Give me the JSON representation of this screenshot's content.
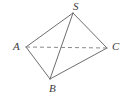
{
  "figure": {
    "type": "geometry-diagram",
    "shape_name": "tetrahedron",
    "width": 124,
    "height": 97,
    "background_color": "#ffffff",
    "line_color": "#6e6e6e",
    "label_color": "#3b3b3b",
    "vertices": [
      {
        "name": "S",
        "label": "S",
        "x": 73,
        "y": 13,
        "label_x": 73,
        "label_y": 1
      },
      {
        "name": "A",
        "label": "A",
        "x": 26,
        "y": 47,
        "label_x": 13,
        "label_y": 41
      },
      {
        "name": "C",
        "label": "C",
        "x": 107,
        "y": 48,
        "label_x": 112,
        "label_y": 41
      },
      {
        "name": "B",
        "label": "B",
        "x": 50,
        "y": 79,
        "label_x": 49,
        "label_y": 83
      }
    ],
    "edges": [
      {
        "name": "edge-S-A",
        "from": "S",
        "to": "A",
        "style": "solid",
        "x1": 73,
        "y1": 13,
        "x2": 26,
        "y2": 47
      },
      {
        "name": "edge-S-C",
        "from": "S",
        "to": "C",
        "style": "solid",
        "x1": 73,
        "y1": 13,
        "x2": 107,
        "y2": 48
      },
      {
        "name": "edge-S-B",
        "from": "S",
        "to": "B",
        "style": "solid",
        "x1": 73,
        "y1": 13,
        "x2": 50,
        "y2": 79
      },
      {
        "name": "edge-A-B",
        "from": "A",
        "to": "B",
        "style": "solid",
        "x1": 26,
        "y1": 47,
        "x2": 50,
        "y2": 79
      },
      {
        "name": "edge-B-C",
        "from": "B",
        "to": "C",
        "style": "solid",
        "x1": 50,
        "y1": 79,
        "x2": 107,
        "y2": 48
      },
      {
        "name": "edge-A-C",
        "from": "A",
        "to": "C",
        "style": "dashed",
        "x1": 26,
        "y1": 47,
        "x2": 107,
        "y2": 48
      }
    ]
  }
}
